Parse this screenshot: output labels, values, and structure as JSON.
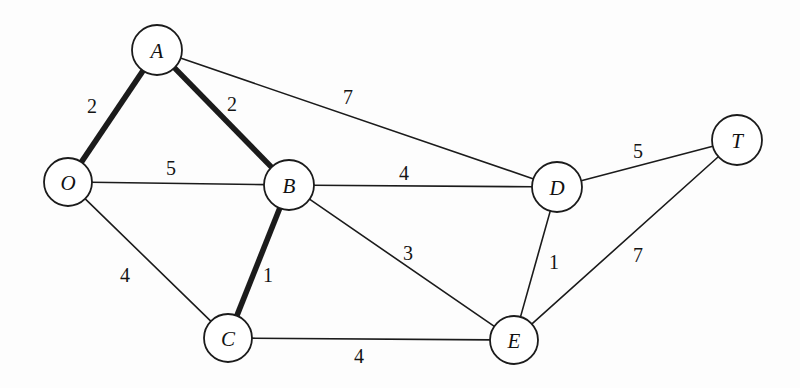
{
  "diagram": {
    "background_color": "#fdfdfd",
    "stroke_color": "#1b1b1b",
    "highlight_note": "bold edges mark the highlighted path/tree"
  },
  "chart_data": {
    "type": "diagram",
    "graph_type": "undirected weighted graph",
    "title": "",
    "nodes": [
      {
        "id": "A",
        "label": "A",
        "x": 157,
        "y": 50,
        "r": 25
      },
      {
        "id": "O",
        "label": "O",
        "x": 68,
        "y": 182,
        "r": 24
      },
      {
        "id": "B",
        "label": "B",
        "x": 289,
        "y": 185,
        "r": 25
      },
      {
        "id": "C",
        "label": "C",
        "x": 228,
        "y": 338,
        "r": 24
      },
      {
        "id": "D",
        "label": "D",
        "x": 557,
        "y": 187,
        "r": 25
      },
      {
        "id": "E",
        "label": "E",
        "x": 514,
        "y": 340,
        "r": 24
      },
      {
        "id": "T",
        "label": "T",
        "x": 737,
        "y": 140,
        "r": 25
      }
    ],
    "edges": [
      {
        "source": "O",
        "target": "A",
        "weight": 2,
        "bold": true,
        "label_x": 92,
        "label_y": 106
      },
      {
        "source": "A",
        "target": "B",
        "weight": 2,
        "bold": true,
        "label_x": 232,
        "label_y": 104
      },
      {
        "source": "A",
        "target": "D",
        "weight": 7,
        "bold": false,
        "label_x": 348,
        "label_y": 97
      },
      {
        "source": "O",
        "target": "B",
        "weight": 5,
        "bold": false,
        "label_x": 171,
        "label_y": 168
      },
      {
        "source": "B",
        "target": "D",
        "weight": 4,
        "bold": false,
        "label_x": 404,
        "label_y": 173
      },
      {
        "source": "D",
        "target": "T",
        "weight": 5,
        "bold": false,
        "label_x": 638,
        "label_y": 151
      },
      {
        "source": "O",
        "target": "C",
        "weight": 4,
        "bold": false,
        "label_x": 125,
        "label_y": 275
      },
      {
        "source": "B",
        "target": "C",
        "weight": 1,
        "bold": true,
        "label_x": 268,
        "label_y": 275
      },
      {
        "source": "B",
        "target": "E",
        "weight": 3,
        "bold": false,
        "label_x": 408,
        "label_y": 253
      },
      {
        "source": "D",
        "target": "E",
        "weight": 1,
        "bold": false,
        "label_x": 554,
        "label_y": 262
      },
      {
        "source": "E",
        "target": "T",
        "weight": 7,
        "bold": false,
        "label_x": 638,
        "label_y": 255
      },
      {
        "source": "C",
        "target": "E",
        "weight": 4,
        "bold": false,
        "label_x": 359,
        "label_y": 356
      }
    ]
  }
}
